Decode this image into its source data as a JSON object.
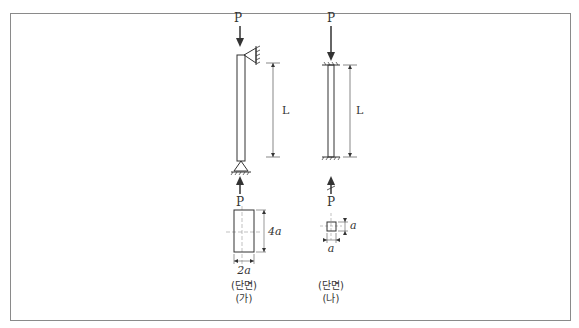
{
  "figure": {
    "column_a": {
      "load_top": "P",
      "load_bottom": "P",
      "length_label": "L",
      "top_support": "pin (wall-mounted)",
      "bottom_support": "pin (triangle)",
      "section": {
        "shape": "rectangle",
        "width_label": "2a",
        "height_label": "4a"
      },
      "section_caption": "(단면)",
      "case_label": "(가)"
    },
    "column_b": {
      "load_top": "P",
      "load_bottom": "P",
      "length_label": "L",
      "top_support": "fixed",
      "bottom_support": "fixed",
      "section": {
        "shape": "square",
        "width_label": "a",
        "height_label": "a"
      },
      "section_caption": "(단면)",
      "case_label": "(나)"
    }
  },
  "colors": {
    "line": "#333333",
    "frame": "#8a8a8a",
    "dim_line": "#555555",
    "center_line": "#999999"
  }
}
